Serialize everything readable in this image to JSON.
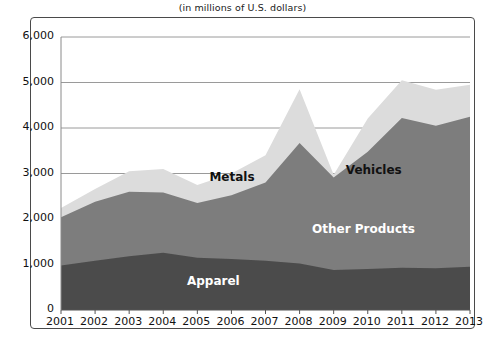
{
  "subtitle": "(in millions of U.S. dollars)",
  "colors": {
    "apparel": "#4b4b4b",
    "other_products": "#7d7d7d",
    "vehicles": "#7d7d7d",
    "metals": "#dcdcdc",
    "gridline": "#9a9a9a",
    "frame": "#4a4a4a",
    "axis_text": "#111111"
  },
  "axis": {
    "y_ticks": [
      "0",
      "1,000",
      "2,000",
      "3,000",
      "4,000",
      "5,000",
      "6,000"
    ],
    "x_ticks": [
      "2001",
      "2002",
      "2003",
      "2004",
      "2005",
      "2006",
      "2007",
      "2008",
      "2009",
      "2010",
      "2011",
      "2012",
      "2013"
    ]
  },
  "labels": {
    "metals": "Metals",
    "vehicles": "Vehicles",
    "other_products": "Other Products",
    "apparel": "Apparel"
  },
  "chart_data": {
    "type": "area",
    "title": "",
    "subtitle": "(in millions of U.S. dollars)",
    "xlabel": "",
    "ylabel": "",
    "ylim": [
      0,
      6000
    ],
    "ytick_step": 1000,
    "grid": true,
    "legend": "inline-annotations",
    "stacked": true,
    "x": [
      2001,
      2002,
      2003,
      2004,
      2005,
      2006,
      2007,
      2008,
      2009,
      2010,
      2011,
      2012,
      2013
    ],
    "categories": [
      "2001",
      "2002",
      "2003",
      "2004",
      "2005",
      "2006",
      "2007",
      "2008",
      "2009",
      "2010",
      "2011",
      "2012",
      "2013"
    ],
    "series": [
      {
        "name": "Apparel",
        "values": [
          980,
          1080,
          1180,
          1260,
          1150,
          1120,
          1080,
          1020,
          880,
          900,
          930,
          920,
          950
        ]
      },
      {
        "name": "Other Products",
        "values": [
          0,
          0,
          0,
          0,
          0,
          0,
          0,
          0,
          0,
          0,
          0,
          0,
          0
        ]
      },
      {
        "name": "Vehicles",
        "values": [
          1060,
          1300,
          1420,
          1320,
          1200,
          1400,
          1720,
          2650,
          2030,
          2580,
          3290,
          3130,
          3300
        ]
      },
      {
        "name": "Metals",
        "values": [
          200,
          280,
          450,
          520,
          400,
          480,
          600,
          1180,
          60,
          730,
          830,
          790,
          700
        ]
      }
    ],
    "totals": [
      2240,
      2660,
      3050,
      3100,
      2750,
      3000,
      3400,
      4850,
      2970,
      4210,
      5050,
      4840,
      4950
    ]
  }
}
